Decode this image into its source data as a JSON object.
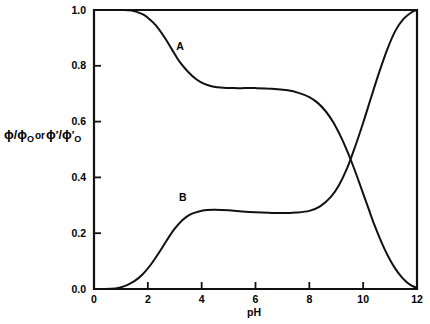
{
  "chart_data": {
    "type": "line",
    "title": "",
    "xlabel": "pH",
    "ylabel": "ϕ/ϕ_O or ϕ'/ϕ'_O",
    "ylabel_parts": {
      "phi": "ϕ",
      "slash": "/",
      "subscript": "O",
      "conjunction": "or",
      "prime": "′"
    },
    "xlim": [
      0,
      12
    ],
    "ylim": [
      0.0,
      1.0
    ],
    "xticks": [
      0,
      2,
      4,
      6,
      8,
      10,
      12
    ],
    "xtick_labels": [
      "0",
      "2",
      "4",
      "6",
      "8",
      "10",
      "12"
    ],
    "yticks": [
      0.0,
      0.2,
      0.4,
      0.6,
      0.8,
      1.0
    ],
    "ytick_labels": [
      "0.0",
      "0.2",
      "0.4",
      "0.6",
      "0.8",
      "1.0"
    ],
    "grid": false,
    "legend_position": "inline-annotations",
    "annotations": [
      {
        "text": "A",
        "x": 3.2,
        "y": 0.855
      },
      {
        "text": "B",
        "x": 3.3,
        "y": 0.315
      }
    ],
    "series": [
      {
        "name": "A",
        "label": "A",
        "color": "#111111",
        "x": [
          0.0,
          0.5,
          1.0,
          1.4,
          1.8,
          2.0,
          2.3,
          2.6,
          2.9,
          3.2,
          3.5,
          3.8,
          4.1,
          4.4,
          4.8,
          5.2,
          5.6,
          6.0,
          6.6,
          7.2,
          7.6,
          8.0,
          8.3,
          8.6,
          8.9,
          9.2,
          9.4,
          9.6,
          9.8,
          10.0,
          10.2,
          10.4,
          10.6,
          10.8,
          11.0,
          11.2,
          11.4,
          11.6,
          11.8,
          12.0
        ],
        "y": [
          1.0,
          1.0,
          1.0,
          0.998,
          0.985,
          0.972,
          0.945,
          0.905,
          0.858,
          0.812,
          0.778,
          0.752,
          0.735,
          0.726,
          0.721,
          0.72,
          0.72,
          0.72,
          0.718,
          0.712,
          0.703,
          0.688,
          0.668,
          0.638,
          0.596,
          0.54,
          0.496,
          0.448,
          0.396,
          0.342,
          0.288,
          0.234,
          0.186,
          0.142,
          0.104,
          0.072,
          0.046,
          0.026,
          0.012,
          0.004
        ]
      },
      {
        "name": "B",
        "label": "B",
        "color": "#111111",
        "x": [
          0.0,
          0.4,
          0.8,
          1.0,
          1.2,
          1.5,
          1.8,
          2.1,
          2.4,
          2.7,
          3.0,
          3.3,
          3.6,
          3.9,
          4.2,
          4.5,
          5.0,
          5.5,
          6.0,
          6.5,
          7.0,
          7.5,
          8.0,
          8.4,
          8.8,
          9.1,
          9.4,
          9.7,
          10.0,
          10.3,
          10.6,
          10.9,
          11.2,
          11.5,
          11.8,
          12.0
        ],
        "y": [
          0.0,
          0.0,
          0.002,
          0.006,
          0.013,
          0.028,
          0.052,
          0.086,
          0.128,
          0.174,
          0.216,
          0.248,
          0.268,
          0.278,
          0.283,
          0.284,
          0.282,
          0.278,
          0.275,
          0.273,
          0.272,
          0.274,
          0.28,
          0.296,
          0.33,
          0.372,
          0.432,
          0.51,
          0.596,
          0.688,
          0.778,
          0.86,
          0.926,
          0.968,
          0.992,
          1.0
        ]
      }
    ]
  },
  "axes": {
    "frame": {
      "left_px": 94,
      "right_px": 417,
      "top_px": 10,
      "bottom_px": 289
    },
    "tick_length_px": 7
  }
}
